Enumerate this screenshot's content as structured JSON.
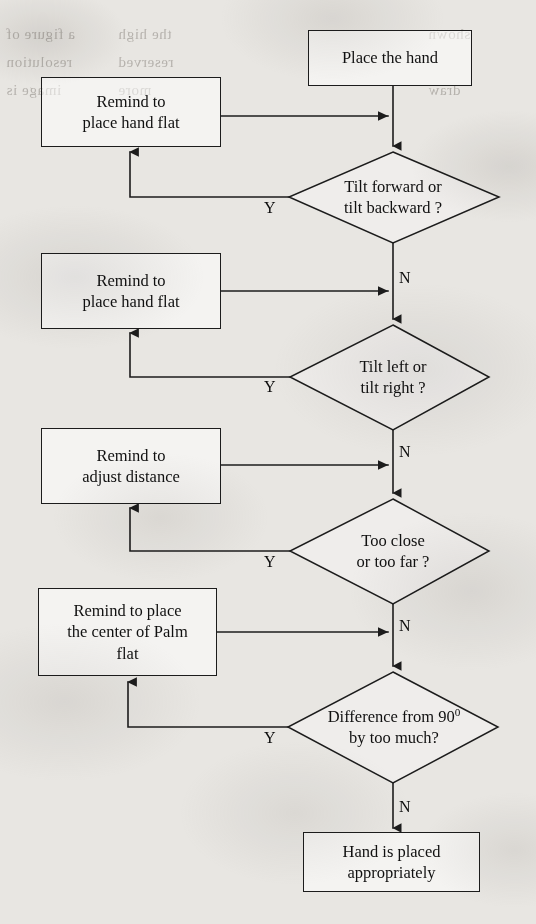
{
  "document": {
    "type": "flowchart",
    "title": "Hand placement guidance flowchart"
  },
  "nodes": {
    "start": {
      "id": "place-the-hand",
      "shape": "process",
      "label": "Place the hand"
    },
    "remind_flat_1": {
      "id": "remind-place-hand-flat-1",
      "shape": "process",
      "line1": "Remind to",
      "line2": "place hand flat"
    },
    "decision_tilt_fb": {
      "id": "tilt-forward-backward",
      "shape": "decision",
      "line1": "Tilt forward or",
      "line2": "tilt backward ?"
    },
    "remind_flat_2": {
      "id": "remind-place-hand-flat-2",
      "shape": "process",
      "line1": "Remind to",
      "line2": "place hand flat"
    },
    "decision_tilt_lr": {
      "id": "tilt-left-right",
      "shape": "decision",
      "line1": "Tilt left or",
      "line2": "tilt right ?"
    },
    "remind_distance": {
      "id": "remind-adjust-distance",
      "shape": "process",
      "line1": "Remind to",
      "line2": "adjust distance"
    },
    "decision_distance": {
      "id": "too-close-too-far",
      "shape": "decision",
      "line1": "Too close",
      "line2": "or too far ?"
    },
    "remind_palm": {
      "id": "remind-place-center-palm-flat",
      "shape": "process",
      "line1": "Remind to place",
      "line2": "the center of Palm",
      "line3": "flat"
    },
    "decision_angle": {
      "id": "difference-from-90-degrees",
      "shape": "decision",
      "line1_pre": "Difference from 90",
      "line1_sup": "0",
      "line2": "by too much?"
    },
    "end": {
      "id": "hand-is-placed-appropriately",
      "shape": "process",
      "line1": "Hand is placed",
      "line2": "appropriately"
    }
  },
  "branches": {
    "yes": "Y",
    "no": "N",
    "labels": [
      {
        "name": "yes-tilt-fb",
        "text": "Y",
        "x": 264,
        "y": 199
      },
      {
        "name": "no-tilt-fb",
        "text": "N",
        "x": 399,
        "y": 269
      },
      {
        "name": "yes-tilt-lr",
        "text": "Y",
        "x": 264,
        "y": 378
      },
      {
        "name": "no-tilt-lr",
        "text": "N",
        "x": 399,
        "y": 443
      },
      {
        "name": "yes-distance",
        "text": "Y",
        "x": 264,
        "y": 553
      },
      {
        "name": "no-distance",
        "text": "N",
        "x": 399,
        "y": 617
      },
      {
        "name": "yes-angle",
        "text": "Y",
        "x": 264,
        "y": 729
      },
      {
        "name": "no-angle",
        "text": "N",
        "x": 399,
        "y": 798
      }
    ]
  },
  "bleed_through": [
    {
      "text": "a figure of",
      "x": 6,
      "y": 34
    },
    {
      "text": "resolution",
      "x": 6,
      "y": 62
    },
    {
      "text": "image is",
      "x": 6,
      "y": 90
    },
    {
      "text": "the high",
      "x": 120,
      "y": 34
    },
    {
      "text": "reserved",
      "x": 120,
      "y": 62
    },
    {
      "text": "more",
      "x": 120,
      "y": 90
    },
    {
      "text": "shown",
      "x": 430,
      "y": 34
    },
    {
      "text": "draw",
      "x": 430,
      "y": 90
    }
  ],
  "colors": {
    "stroke": "#1c1c1c",
    "text": "#101010",
    "paper": "#e8e6e2"
  }
}
